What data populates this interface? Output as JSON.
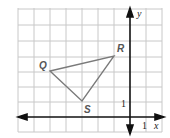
{
  "diagram": {
    "type": "coordinate-plane",
    "axes": {
      "x_label": "x",
      "y_label": "y",
      "x_unit_label": "1",
      "y_unit_label": "1"
    },
    "grid": {
      "x_min": -7,
      "x_max": 2,
      "y_min": -1,
      "y_max": 7
    },
    "triangle": {
      "vertices": [
        {
          "name": "Q",
          "x": -5,
          "y": 3
        },
        {
          "name": "R",
          "x": -1,
          "y": 4
        },
        {
          "name": "S",
          "x": -3,
          "y": 1
        }
      ],
      "stroke_color": "#7a7a7a"
    },
    "colors": {
      "grid": "#c8c8c8",
      "axis": "#111111"
    }
  }
}
